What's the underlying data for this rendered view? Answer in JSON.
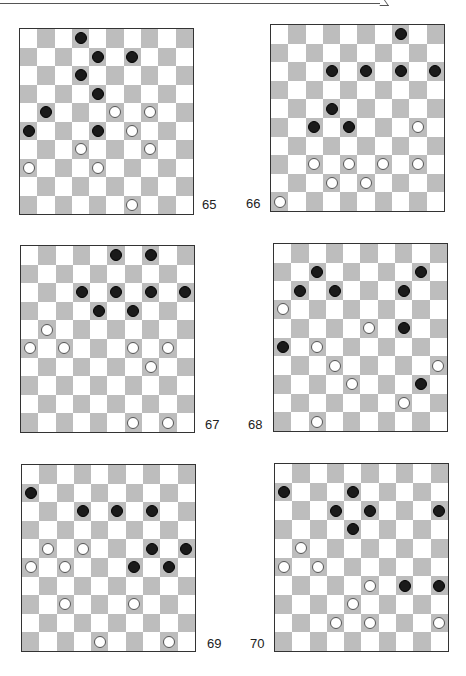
{
  "page": {
    "type": "draughts diagrams",
    "board_size": 10,
    "colors": {
      "light_square": "#ffffff",
      "dark_square": "#bdbdbd",
      "black_piece": "#1a1a1a",
      "white_piece": "#ffffff",
      "border": "#333333"
    }
  },
  "diagrams": [
    {
      "number": "65",
      "black": [
        [
          0,
          3
        ],
        [
          1,
          4
        ],
        [
          1,
          6
        ],
        [
          2,
          3
        ],
        [
          3,
          4
        ],
        [
          4,
          1
        ],
        [
          5,
          0
        ],
        [
          5,
          4
        ]
      ],
      "white": [
        [
          4,
          5
        ],
        [
          4,
          7
        ],
        [
          5,
          6
        ],
        [
          6,
          3
        ],
        [
          6,
          7
        ],
        [
          7,
          0
        ],
        [
          7,
          4
        ],
        [
          9,
          6
        ]
      ]
    },
    {
      "number": "66",
      "black": [
        [
          0,
          7
        ],
        [
          2,
          3
        ],
        [
          2,
          5
        ],
        [
          2,
          7
        ],
        [
          2,
          9
        ],
        [
          4,
          3
        ],
        [
          5,
          2
        ],
        [
          5,
          4
        ]
      ],
      "white": [
        [
          5,
          8
        ],
        [
          7,
          2
        ],
        [
          7,
          4
        ],
        [
          7,
          6
        ],
        [
          7,
          8
        ],
        [
          8,
          3
        ],
        [
          8,
          5
        ],
        [
          9,
          0
        ]
      ]
    },
    {
      "number": "67",
      "black": [
        [
          0,
          5
        ],
        [
          0,
          7
        ],
        [
          2,
          3
        ],
        [
          2,
          5
        ],
        [
          2,
          7
        ],
        [
          2,
          9
        ],
        [
          3,
          4
        ],
        [
          3,
          6
        ]
      ],
      "white": [
        [
          4,
          1
        ],
        [
          5,
          0
        ],
        [
          5,
          2
        ],
        [
          5,
          6
        ],
        [
          5,
          8
        ],
        [
          6,
          7
        ],
        [
          9,
          6
        ],
        [
          9,
          8
        ]
      ]
    },
    {
      "number": "68",
      "black": [
        [
          1,
          2
        ],
        [
          1,
          8
        ],
        [
          2,
          1
        ],
        [
          2,
          3
        ],
        [
          2,
          7
        ],
        [
          4,
          7
        ],
        [
          5,
          0
        ],
        [
          7,
          8
        ]
      ],
      "white": [
        [
          3,
          0
        ],
        [
          4,
          5
        ],
        [
          5,
          2
        ],
        [
          6,
          3
        ],
        [
          6,
          9
        ],
        [
          7,
          4
        ],
        [
          8,
          7
        ],
        [
          9,
          2
        ]
      ]
    },
    {
      "number": "69",
      "black": [
        [
          1,
          0
        ],
        [
          2,
          3
        ],
        [
          2,
          5
        ],
        [
          2,
          7
        ],
        [
          4,
          7
        ],
        [
          4,
          9
        ],
        [
          5,
          6
        ],
        [
          5,
          8
        ]
      ],
      "white": [
        [
          4,
          1
        ],
        [
          4,
          3
        ],
        [
          5,
          0
        ],
        [
          5,
          2
        ],
        [
          7,
          2
        ],
        [
          7,
          6
        ],
        [
          9,
          4
        ],
        [
          9,
          8
        ]
      ]
    },
    {
      "number": "70",
      "black": [
        [
          1,
          0
        ],
        [
          1,
          4
        ],
        [
          2,
          3
        ],
        [
          2,
          5
        ],
        [
          2,
          9
        ],
        [
          3,
          4
        ],
        [
          6,
          7
        ],
        [
          6,
          9
        ]
      ],
      "white": [
        [
          4,
          1
        ],
        [
          5,
          0
        ],
        [
          5,
          2
        ],
        [
          6,
          5
        ],
        [
          7,
          4
        ],
        [
          8,
          3
        ],
        [
          8,
          5
        ],
        [
          8,
          9
        ]
      ]
    }
  ]
}
